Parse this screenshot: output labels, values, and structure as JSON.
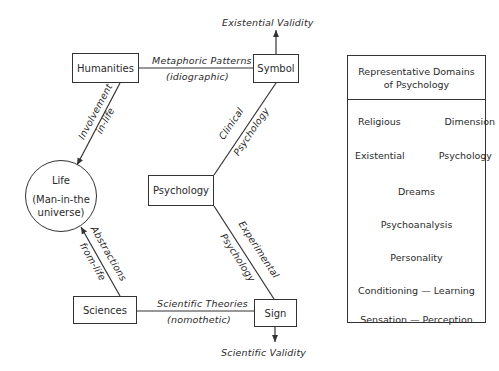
{
  "diagram": {
    "nodes": {
      "humanities": "Humanities",
      "symbol": "Symbol",
      "psychology": "Psychology",
      "sciences": "Sciences",
      "sign": "Sign",
      "life": {
        "title": "Life",
        "subtitle_line1": "(Man-in-the",
        "subtitle_line2": "universe)"
      }
    },
    "edges": {
      "metaphoric": {
        "line1": "Metaphoric Patterns",
        "line2": "(idiographic)"
      },
      "scientific_theories": {
        "line1": "Scientific Theories",
        "line2": "(nomothetic)"
      },
      "involvement": {
        "line1": "Involvement",
        "line2": "in-life"
      },
      "abstractions": {
        "line1": "Abstractions",
        "line2": "from-life"
      },
      "clinical": {
        "line1": "Clinical",
        "line2": "Psychology"
      },
      "experimental": {
        "line1": "Experimental",
        "line2": "Psychology"
      }
    },
    "outputs": {
      "existential_validity": "Existential Validity",
      "scientific_validity": "Scientific Validity"
    }
  },
  "panel": {
    "title_line1": "Representative Domains",
    "title_line2": "of Psychology",
    "rows": [
      {
        "left": "Religious",
        "right": "Dimension"
      },
      {
        "left": "Existential",
        "right": "Psychology"
      },
      {
        "single": "Dreams"
      },
      {
        "single": "Psychoanalysis"
      },
      {
        "single": "Personality"
      },
      {
        "single": "Conditioning — Learning"
      },
      {
        "single": "Sensation — Perception"
      }
    ]
  }
}
